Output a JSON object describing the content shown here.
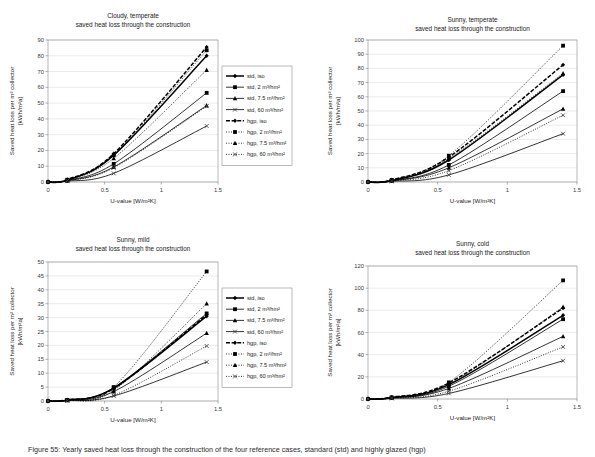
{
  "figure": {
    "caption": "Figure 55: Yearly saved heat loss through the construction of the four reference cases, standard (std) and highly glazed (hgp)",
    "subtitle_common": "saved heat loss through the construction",
    "axis": {
      "x_label": "U-value [W/m²K]",
      "y_label_line1": "Saved heat loss per m² collector",
      "y_label_line2": "[kWh/m²a]"
    },
    "x_ticks": [
      "0",
      "0.5",
      "1",
      "1.5"
    ],
    "x_tick_values": [
      0,
      0.5,
      1,
      1.5
    ],
    "x_range": [
      0,
      1.5
    ]
  },
  "legend": {
    "items": [
      {
        "label": "std, iso",
        "marker": "diamond",
        "dash": "none",
        "width": 1.5
      },
      {
        "label": "std, 2 m³/hm²",
        "marker": "square",
        "dash": "none",
        "width": 0.8
      },
      {
        "label": "std, 7.5 m³/hm²",
        "marker": "triangle",
        "dash": "none",
        "width": 0.8
      },
      {
        "label": "std, 60 m³/hm²",
        "marker": "cross",
        "dash": "none",
        "width": 0.8
      },
      {
        "label": "hgp, iso",
        "marker": "diamond",
        "dash": "dash",
        "width": 1.5
      },
      {
        "label": "hgp, 2 m³/hm²",
        "marker": "square",
        "dash": "dot",
        "width": 0.8
      },
      {
        "label": "hgp, 7.5 m³/hm²",
        "marker": "triangle",
        "dash": "dot",
        "width": 0.8
      },
      {
        "label": "hgp, 60 m³/hm²",
        "marker": "cross",
        "dash": "dot",
        "width": 0.8
      }
    ]
  },
  "chart_data": [
    {
      "id": "cloudy-temperate",
      "type": "line",
      "title": "Cloudy, temperate",
      "subtitle": "saved heat loss through the construction",
      "xlabel": "U-value [W/m²K]",
      "ylabel": "Saved heat loss per m² collector [kWh/m²a]",
      "xlim": [
        0,
        1.5
      ],
      "ylim": [
        0,
        90
      ],
      "ytick_step": 10,
      "yticks": [
        0,
        10,
        20,
        30,
        40,
        50,
        60,
        70,
        80,
        90
      ],
      "xticks": [
        0,
        0.5,
        1,
        1.5
      ],
      "grid": true,
      "legend_position": "right",
      "x": [
        0,
        0.17,
        0.58,
        1.4
      ],
      "series": [
        {
          "name": "std, iso",
          "values": [
            0,
            1.2,
            17.0,
            80.0
          ]
        },
        {
          "name": "std, 2 m³/hm²",
          "values": [
            0,
            1.0,
            11.5,
            56.5
          ]
        },
        {
          "name": "std, 7.5 m³/hm²",
          "values": [
            0,
            0.8,
            9.5,
            48.5
          ]
        },
        {
          "name": "std, 60 m³/hm²",
          "values": [
            0,
            0.5,
            5.5,
            35.5
          ]
        },
        {
          "name": "hgp, iso",
          "values": [
            0,
            1.6,
            18.0,
            85.5
          ]
        },
        {
          "name": "hgp, 2 m³/hm²",
          "values": [
            0,
            1.4,
            17.0,
            83.5
          ]
        },
        {
          "name": "hgp, 7.5 m³/hm²",
          "values": [
            0,
            1.2,
            15.0,
            71.0
          ]
        },
        {
          "name": "hgp, 60 m³/hm²",
          "values": [
            0,
            0.8,
            9.0,
            48.0
          ]
        }
      ]
    },
    {
      "id": "sunny-temperate",
      "type": "line",
      "title": "Sunny, temperate",
      "subtitle": "saved heat loss through the construction",
      "xlabel": "U-value [W/m²K]",
      "ylabel": "Saved heat loss per m² collector [kWh/m²a]",
      "xlim": [
        0,
        1.5
      ],
      "ylim": [
        0,
        100
      ],
      "ytick_step": 10,
      "yticks": [
        0,
        10,
        20,
        30,
        40,
        50,
        60,
        70,
        80,
        90,
        100
      ],
      "xticks": [
        0,
        0.5,
        1,
        1.5
      ],
      "grid": true,
      "legend_position": "none",
      "x": [
        0,
        0.17,
        0.58,
        1.4
      ],
      "series": [
        {
          "name": "std, iso",
          "values": [
            0,
            1.0,
            15.5,
            75.5
          ]
        },
        {
          "name": "std, 2 m³/hm²",
          "values": [
            0,
            0.9,
            12.0,
            64.0
          ]
        },
        {
          "name": "std, 7.5 m³/hm²",
          "values": [
            0,
            0.7,
            10.0,
            51.5
          ]
        },
        {
          "name": "std, 60 m³/hm²",
          "values": [
            0,
            0.4,
            5.0,
            34.0
          ]
        },
        {
          "name": "hgp, iso",
          "values": [
            0,
            1.5,
            17.5,
            82.5
          ]
        },
        {
          "name": "hgp, 2 m³/hm²",
          "values": [
            0,
            1.4,
            18.5,
            96.0
          ]
        },
        {
          "name": "hgp, 7.5 m³/hm²",
          "values": [
            0,
            1.1,
            16.5,
            76.5
          ]
        },
        {
          "name": "hgp, 60 m³/hm²",
          "values": [
            0,
            0.7,
            8.0,
            47.0
          ]
        }
      ]
    },
    {
      "id": "sunny-mild",
      "type": "line",
      "title": "Sunny, mild",
      "subtitle": "saved heat loss through the construction",
      "xlabel": "U-value [W/m²K]",
      "ylabel": "Saved heat loss per m² collector [kWh/m²a]",
      "xlim": [
        0,
        1.5
      ],
      "ylim": [
        0,
        50
      ],
      "ytick_step": 5,
      "yticks": [
        0,
        5,
        10,
        15,
        20,
        25,
        30,
        35,
        40,
        45,
        50
      ],
      "xticks": [
        0,
        0.5,
        1,
        1.5
      ],
      "grid": true,
      "legend_position": "right",
      "x": [
        0,
        0.17,
        0.58,
        1.4
      ],
      "series": [
        {
          "name": "std, iso",
          "values": [
            0,
            0.3,
            4.6,
            30.5
          ]
        },
        {
          "name": "std, 2 m³/hm²",
          "values": [
            0,
            0.3,
            4.8,
            31.5
          ]
        },
        {
          "name": "std, 7.5 m³/hm²",
          "values": [
            0,
            0.2,
            3.4,
            24.4
          ]
        },
        {
          "name": "std, 60 m³/hm²",
          "values": [
            0,
            0.1,
            1.8,
            14.0
          ]
        },
        {
          "name": "hgp, iso",
          "values": [
            0,
            0.4,
            4.5,
            31.0
          ]
        },
        {
          "name": "hgp, 2 m³/hm²",
          "values": [
            0,
            0.4,
            5.0,
            46.6
          ]
        },
        {
          "name": "hgp, 7.5 m³/hm²",
          "values": [
            0,
            0.3,
            3.8,
            35.0
          ]
        },
        {
          "name": "hgp, 60 m³/hm²",
          "values": [
            0,
            0.2,
            2.0,
            19.8
          ]
        }
      ]
    },
    {
      "id": "sunny-cold",
      "type": "line",
      "title": "Sunny, cold",
      "subtitle": "saved heat loss through the construction",
      "xlabel": "U-value [W/m²K]",
      "ylabel": "Saved heat loss per m² collector [kWh/m²a]",
      "xlim": [
        0,
        1.5
      ],
      "ylim": [
        0,
        120
      ],
      "ytick_step": 20,
      "yticks": [
        0,
        20,
        40,
        60,
        80,
        100,
        120
      ],
      "xticks": [
        0,
        0.5,
        1,
        1.5
      ],
      "grid": true,
      "legend_position": "none",
      "x": [
        0,
        0.17,
        0.58,
        1.4
      ],
      "series": [
        {
          "name": "std, iso",
          "values": [
            0,
            1.2,
            13.0,
            75.5
          ]
        },
        {
          "name": "std, 2 m³/hm²",
          "values": [
            0,
            1.1,
            11.5,
            72.0
          ]
        },
        {
          "name": "std, 7.5 m³/hm²",
          "values": [
            0,
            0.9,
            9.5,
            56.5
          ]
        },
        {
          "name": "std, 60 m³/hm²",
          "values": [
            0,
            0.5,
            5.0,
            34.5
          ]
        },
        {
          "name": "hgp, iso",
          "values": [
            0,
            1.6,
            14.5,
            82.0
          ]
        },
        {
          "name": "hgp, 2 m³/hm²",
          "values": [
            0,
            1.5,
            15.0,
            107.0
          ]
        },
        {
          "name": "hgp, 7.5 m³/hm²",
          "values": [
            0,
            1.3,
            13.5,
            83.0
          ]
        },
        {
          "name": "hgp, 60 m³/hm²",
          "values": [
            0,
            0.8,
            7.0,
            47.0
          ]
        }
      ]
    }
  ]
}
